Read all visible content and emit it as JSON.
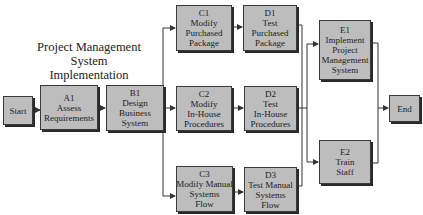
{
  "title": {
    "line1": "Project Management",
    "line2": "System Implementation"
  },
  "nodes": {
    "start": {
      "label": "Start"
    },
    "a1": {
      "id": "A1",
      "line1": "Assess",
      "line2": "Requirements"
    },
    "b1": {
      "id": "B1",
      "line1": "Design",
      "line2": "Business",
      "line3": "System"
    },
    "c1": {
      "id": "C1",
      "line1": "Modify",
      "line2": "Purchased",
      "line3": "Package"
    },
    "d1": {
      "id": "D1",
      "line1": "Test",
      "line2": "Purchased",
      "line3": "Package"
    },
    "c2": {
      "id": "C2",
      "line1": "Modify",
      "line2": "In-House",
      "line3": "Procedures"
    },
    "d2": {
      "id": "D2",
      "line1": "Test",
      "line2": "In-House",
      "line3": "Procedures"
    },
    "c3": {
      "id": "C3",
      "line1": "Modify Manual",
      "line2": "Systems",
      "line3": "Flow"
    },
    "d3": {
      "id": "D3",
      "line1": "Test Manual",
      "line2": "Systems",
      "line3": "Flow"
    },
    "e1": {
      "id": "E1",
      "line1": "Implement",
      "line2": "Project",
      "line3": "Management",
      "line4": "System"
    },
    "e2": {
      "id": "E2",
      "line1": "Train",
      "line2": "Staff"
    },
    "end": {
      "label": "End"
    }
  },
  "colors": {
    "node_fill": "#bdbdbd",
    "node_border": "#3a3a3a",
    "line": "#333333",
    "background": "#ffffff"
  }
}
